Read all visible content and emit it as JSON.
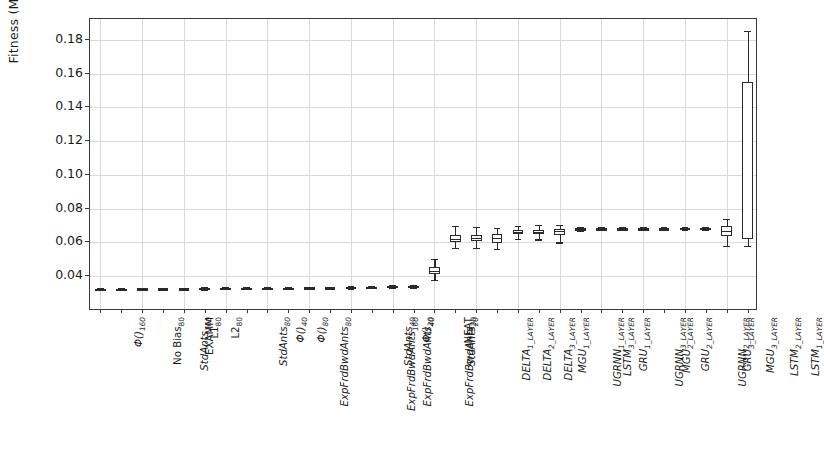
{
  "chart_data": {
    "type": "box",
    "title": "",
    "xlabel": "",
    "ylabel": "Fitness (MAE)",
    "ylim": [
      0.0194,
      0.1924
    ],
    "yticks": [
      0.04,
      0.06,
      0.08,
      0.1,
      0.12,
      0.14,
      0.16,
      0.18
    ],
    "ytick_labels": [
      "0.04",
      "0.06",
      "0.08",
      "0.10",
      "0.12",
      "0.14",
      "0.16",
      "0.18"
    ],
    "grid": true,
    "legend": null,
    "categories": [
      "Φ()160",
      "No Bias80",
      "StdAnts160",
      "EXAMM",
      "L180",
      "L280",
      "StdAnts80",
      "ExpFrdBwdAnts80",
      "Φ()40",
      "Φ()80",
      "ExpFrdBwdAnts160",
      "ExpFrdBwdAnts40",
      "StdAnts40",
      "ExpFrdBwdAnts20",
      "Φ()20",
      "StdAnts20",
      "NEAT",
      "DELTA1_LAYER",
      "DELTA2_LAYER",
      "DELTA3_LAYER",
      "MGU1_LAYER",
      "UGRNN1_LAYER",
      "LSTM3_LAYER",
      "GRU1_LAYER",
      "UGRNN3_LAYER",
      "MGU2_LAYER",
      "GRU2_LAYER",
      "UGRNN2_LAYER",
      "GRU3_LAYER",
      "MGU3_LAYER",
      "LSTM2_LAYER",
      "LSTM1_LAYER"
    ],
    "tick_labels": [
      {
        "base": "Φ()",
        "sub": "160",
        "italic": true
      },
      {
        "base": "No Bias",
        "sub": "80",
        "italic": false
      },
      {
        "base": "StdAnts",
        "sub": "160",
        "italic": true
      },
      {
        "base": "EXAMM",
        "sub": "",
        "italic": false
      },
      {
        "base": "L1",
        "sub": "80",
        "italic": false
      },
      {
        "base": "L2",
        "sub": "80",
        "italic": false
      },
      {
        "base": "StdAnts",
        "sub": "80",
        "italic": true
      },
      {
        "base": "ExpFrdBwdAnts",
        "sub": "80",
        "italic": true
      },
      {
        "base": "Φ()",
        "sub": "40",
        "italic": true
      },
      {
        "base": "Φ()",
        "sub": "80",
        "italic": true
      },
      {
        "base": "ExpFrdBwdAnts",
        "sub": "160",
        "italic": true
      },
      {
        "base": "ExpFrdBwdAnts",
        "sub": "40",
        "italic": true
      },
      {
        "base": "StdAnts",
        "sub": "40",
        "italic": true
      },
      {
        "base": "ExpFrdBwdAnts",
        "sub": "20",
        "italic": true
      },
      {
        "base": "Φ()",
        "sub": "20",
        "italic": true
      },
      {
        "base": "StdAnts",
        "sub": "20",
        "italic": true
      },
      {
        "base": "NEAT",
        "sub": "",
        "italic": false
      },
      {
        "base": "DELTA",
        "sub": "1_LAYER",
        "italic": true
      },
      {
        "base": "DELTA",
        "sub": "2_LAYER",
        "italic": true
      },
      {
        "base": "DELTA",
        "sub": "3_LAYER",
        "italic": true
      },
      {
        "base": "MGU",
        "sub": "1_LAYER",
        "italic": true
      },
      {
        "base": "UGRNN",
        "sub": "1_LAYER",
        "italic": true
      },
      {
        "base": "LSTM",
        "sub": "3_LAYER",
        "italic": true
      },
      {
        "base": "GRU",
        "sub": "1_LAYER",
        "italic": true
      },
      {
        "base": "UGRNN",
        "sub": "3_LAYER",
        "italic": true
      },
      {
        "base": "MGU",
        "sub": "2_LAYER",
        "italic": true
      },
      {
        "base": "GRU",
        "sub": "2_LAYER",
        "italic": true
      },
      {
        "base": "UGRNN",
        "sub": "2_LAYER",
        "italic": true
      },
      {
        "base": "GRU",
        "sub": "3_LAYER",
        "italic": true
      },
      {
        "base": "MGU",
        "sub": "3_LAYER",
        "italic": true
      },
      {
        "base": "LSTM",
        "sub": "2_LAYER",
        "italic": true
      },
      {
        "base": "LSTM",
        "sub": "1_LAYER",
        "italic": true
      }
    ],
    "boxes": [
      {
        "label": "Φ()160",
        "whislo": 0.0318,
        "q1": 0.0322,
        "med": 0.0324,
        "q3": 0.0326,
        "whishi": 0.033
      },
      {
        "label": "No Bias80",
        "whislo": 0.0319,
        "q1": 0.0323,
        "med": 0.0325,
        "q3": 0.0327,
        "whishi": 0.0331
      },
      {
        "label": "StdAnts160",
        "whislo": 0.032,
        "q1": 0.0324,
        "med": 0.0326,
        "q3": 0.0328,
        "whishi": 0.0332
      },
      {
        "label": "EXAMM",
        "whislo": 0.032,
        "q1": 0.0324,
        "med": 0.0326,
        "q3": 0.0329,
        "whishi": 0.0333
      },
      {
        "label": "L180",
        "whislo": 0.0321,
        "q1": 0.0325,
        "med": 0.0327,
        "q3": 0.0329,
        "whishi": 0.0333
      },
      {
        "label": "L280",
        "whislo": 0.0321,
        "q1": 0.0325,
        "med": 0.0327,
        "q3": 0.033,
        "whishi": 0.0334
      },
      {
        "label": "StdAnts80",
        "whislo": 0.0322,
        "q1": 0.0326,
        "med": 0.0328,
        "q3": 0.033,
        "whishi": 0.0334
      },
      {
        "label": "ExpFrdBwdAnts80",
        "whislo": 0.0322,
        "q1": 0.0326,
        "med": 0.0329,
        "q3": 0.0331,
        "whishi": 0.0335
      },
      {
        "label": "Φ()40",
        "whislo": 0.0323,
        "q1": 0.0327,
        "med": 0.0329,
        "q3": 0.0332,
        "whishi": 0.0336
      },
      {
        "label": "Φ()80",
        "whislo": 0.0324,
        "q1": 0.0328,
        "med": 0.033,
        "q3": 0.0333,
        "whishi": 0.0337
      },
      {
        "label": "ExpFrdBwdAnts160",
        "whislo": 0.0325,
        "q1": 0.0329,
        "med": 0.0331,
        "q3": 0.0334,
        "whishi": 0.0338
      },
      {
        "label": "ExpFrdBwdAnts40",
        "whislo": 0.0326,
        "q1": 0.033,
        "med": 0.0332,
        "q3": 0.0335,
        "whishi": 0.0339
      },
      {
        "label": "StdAnts40",
        "whislo": 0.0327,
        "q1": 0.0331,
        "med": 0.0334,
        "q3": 0.0337,
        "whishi": 0.0341
      },
      {
        "label": "ExpFrdBwdAnts20",
        "whislo": 0.0329,
        "q1": 0.0333,
        "med": 0.0336,
        "q3": 0.0339,
        "whishi": 0.0343
      },
      {
        "label": "Φ()20",
        "whislo": 0.0331,
        "q1": 0.0336,
        "med": 0.0339,
        "q3": 0.0342,
        "whishi": 0.0347
      },
      {
        "label": "StdAnts20",
        "whislo": 0.0332,
        "q1": 0.0337,
        "med": 0.034,
        "q3": 0.0343,
        "whishi": 0.0348
      },
      {
        "label": "NEAT",
        "whislo": 0.0378,
        "q1": 0.0415,
        "med": 0.0432,
        "q3": 0.0455,
        "whishi": 0.05
      },
      {
        "label": "DELTA1_LAYER",
        "whislo": 0.0565,
        "q1": 0.0602,
        "med": 0.062,
        "q3": 0.0645,
        "whishi": 0.07
      },
      {
        "label": "DELTA2_LAYER",
        "whislo": 0.057,
        "q1": 0.0608,
        "med": 0.0625,
        "q3": 0.0645,
        "whishi": 0.069
      },
      {
        "label": "DELTA3_LAYER",
        "whislo": 0.056,
        "q1": 0.0598,
        "med": 0.0628,
        "q3": 0.065,
        "whishi": 0.0685
      },
      {
        "label": "MGU1_LAYER",
        "whislo": 0.062,
        "q1": 0.065,
        "med": 0.0662,
        "q3": 0.0672,
        "whishi": 0.07
      },
      {
        "label": "UGRNN1_LAYER",
        "whislo": 0.0618,
        "q1": 0.0652,
        "med": 0.0665,
        "q3": 0.0675,
        "whishi": 0.0702
      },
      {
        "label": "LSTM3_LAYER",
        "whislo": 0.06,
        "q1": 0.0645,
        "med": 0.0668,
        "q3": 0.068,
        "whishi": 0.0706
      },
      {
        "label": "GRU1_LAYER",
        "whislo": 0.0668,
        "q1": 0.0676,
        "med": 0.068,
        "q3": 0.0684,
        "whishi": 0.0692
      },
      {
        "label": "UGRNN3_LAYER",
        "whislo": 0.0672,
        "q1": 0.0678,
        "med": 0.0681,
        "q3": 0.0684,
        "whishi": 0.069
      },
      {
        "label": "MGU2_LAYER",
        "whislo": 0.0673,
        "q1": 0.0679,
        "med": 0.0681,
        "q3": 0.0684,
        "whishi": 0.069
      },
      {
        "label": "GRU2_LAYER",
        "whislo": 0.0673,
        "q1": 0.0679,
        "med": 0.0682,
        "q3": 0.0685,
        "whishi": 0.0691
      },
      {
        "label": "UGRNN2_LAYER",
        "whislo": 0.0674,
        "q1": 0.068,
        "med": 0.0682,
        "q3": 0.0685,
        "whishi": 0.0691
      },
      {
        "label": "GRU3_LAYER",
        "whislo": 0.0674,
        "q1": 0.068,
        "med": 0.0683,
        "q3": 0.0686,
        "whishi": 0.0692
      },
      {
        "label": "MGU3_LAYER",
        "whislo": 0.0675,
        "q1": 0.0681,
        "med": 0.0683,
        "q3": 0.0686,
        "whishi": 0.0692
      },
      {
        "label": "LSTM2_LAYER",
        "whislo": 0.058,
        "q1": 0.064,
        "med": 0.0668,
        "q3": 0.07,
        "whishi": 0.074
      },
      {
        "label": "LSTM1_LAYER",
        "whislo": 0.0578,
        "q1": 0.062,
        "med": 0.0628,
        "q3": 0.155,
        "whishi": 0.1855
      }
    ]
  }
}
